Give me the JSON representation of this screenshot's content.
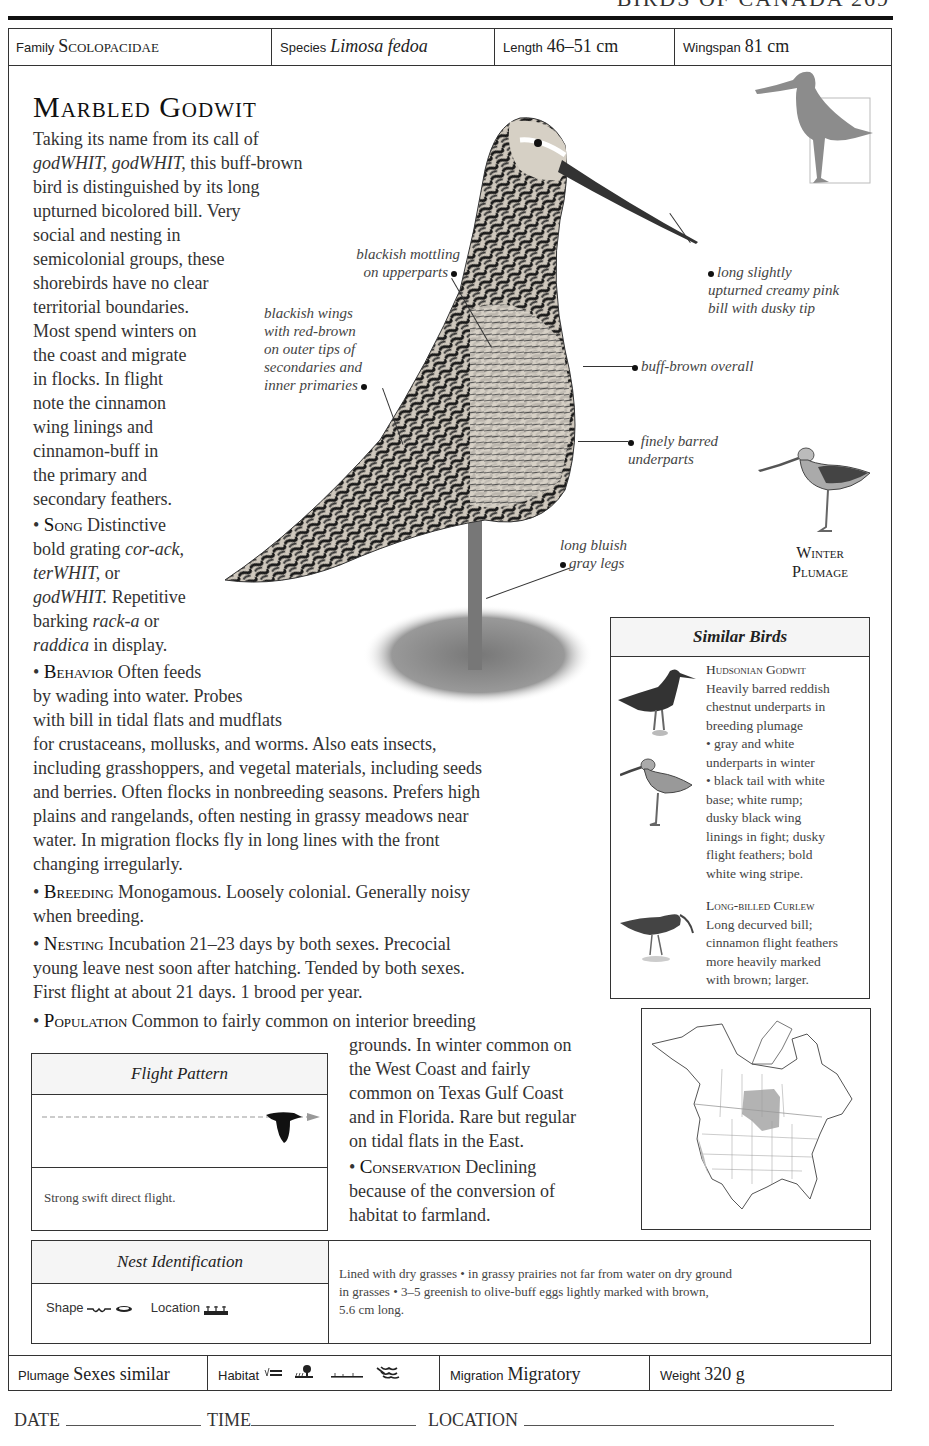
{
  "running_head": "BIRDS OF CANADA  269",
  "header": {
    "family_label": "Family",
    "family_value": "Scolopacidae",
    "species_label": "Species",
    "species_value": "Limosa fedoa",
    "length_label": "Length",
    "length_value": "46–51 cm",
    "wingspan_label": "Wingspan",
    "wingspan_value": "81 cm"
  },
  "title": "Marbled Godwit",
  "intro": {
    "l1": "Taking its name from its call of",
    "l2a": "godWHIT, godWHIT,",
    "l2b": " this buff-brown",
    "l3": "bird is distinguished by its long",
    "l4": "upturned bicolored bill. Very",
    "l5": "social and nesting in",
    "l6": "semicolonial groups, these",
    "l7": "shorebirds have no clear",
    "l8": "territorial boundaries.",
    "l9": "Most spend winters on",
    "l10": "the coast and migrate",
    "l11": "in flocks. In flight",
    "l12": "note the cinnamon",
    "l13": "wing linings and",
    "l14": "cinnamon-buff in",
    "l15": "the primary and",
    "l16": "secondary feathers."
  },
  "song": {
    "label": "Song",
    "l1": " Distinctive",
    "l2a": "bold grating ",
    "l2b": "cor-ack,",
    "l3a": "terWHIT,",
    "l3b": " or",
    "l4a": "godWHIT.",
    "l4b": " Repetitive",
    "l5a": "barking ",
    "l5b": "rack-a",
    "l5c": " or",
    "l6a": "raddica",
    "l6b": " in display."
  },
  "behavior": {
    "label": "Behavior",
    "l1": " Often feeds",
    "l2": "by wading into water. Probes",
    "l3": "with bill in tidal flats and mudflats",
    "l4": "for crustaceans, mollusks, and worms. Also eats insects,",
    "l5": "including grasshoppers, and vegetal materials, including seeds",
    "l6": "and berries. Often flocks in nonbreeding seasons. Prefers high",
    "l7": "plains and rangelands, often nesting in grassy meadows near",
    "l8": "water. In migration flocks fly in long lines with the front",
    "l9": "changing irregularly."
  },
  "breeding": {
    "label": "Breeding",
    "l1": " Monogamous. Loosely colonial. Generally noisy",
    "l2": "when breeding."
  },
  "nesting": {
    "label": "Nesting",
    "l1": " Incubation 21–23 days by both sexes. Precocial",
    "l2": "young leave nest soon after hatching. Tended by both sexes.",
    "l3": "First flight at about 21 days. 1 brood per year."
  },
  "population": {
    "label": "Population",
    "l1": " Common to fairly common on interior breeding",
    "l2": "grounds. In winter common on",
    "l3": "the West Coast and fairly",
    "l4": "common on Texas Gulf Coast",
    "l5": "and in Florida. Rare but regular",
    "l6": "on tidal flats in the East."
  },
  "conservation": {
    "label": "Conservation",
    "l1": " Declining",
    "l2": "because of the conversion of",
    "l3": "habitat to farmland."
  },
  "annotations": {
    "mottling_1": "blackish mottling",
    "mottling_2": "on upperparts",
    "wings_1": "blackish wings",
    "wings_2": "with red-brown",
    "wings_3": "on outer tips of",
    "wings_4": "secondaries and",
    "wings_5": "inner primaries",
    "bill_1": "long slightly",
    "bill_2": "upturned creamy pink",
    "bill_3": "bill with dusky tip",
    "overall": "buff-brown overall",
    "under_1": "finely barred",
    "under_2": "underparts",
    "legs_1": "long bluish",
    "legs_2": "gray legs",
    "winter_1": "Winter",
    "winter_2": "Plumage"
  },
  "similar_birds": {
    "title": "Similar Birds",
    "items": [
      {
        "name": "Hudsonian Godwit",
        "lines": [
          "Heavily barred reddish",
          "chestnut underparts in",
          "breeding plumage",
          "• gray and white",
          "underparts in winter",
          "• black tail with white",
          "base; white rump;",
          "dusky black wing",
          "linings in fight; dusky",
          "flight feathers; bold",
          "white wing stripe."
        ]
      },
      {
        "name": "Long-billed Curlew",
        "lines": [
          "Long decurved bill;",
          "cinnamon flight feathers",
          "more heavily marked",
          "with brown; larger."
        ]
      }
    ]
  },
  "flight_pattern": {
    "title": "Flight Pattern",
    "description": "Strong swift direct flight."
  },
  "nest_identification": {
    "title": "Nest Identification",
    "shape_label": "Shape",
    "location_label": "Location",
    "description_1": "Lined with dry grasses • in grassy prairies not far from water on dry ground",
    "description_2": "in grasses • 3–5 greenish to olive-buff eggs lightly marked with brown,",
    "description_3": "5.6 cm long."
  },
  "footer": {
    "plumage_label": "Plumage",
    "plumage_value": "Sexes similar",
    "habitat_label": "Habitat",
    "habitat_icons": [
      "marsh-icon",
      "tree-grassland-icon",
      "open-plains-icon",
      "shore-waves-icon"
    ],
    "migration_label": "Migration",
    "migration_value": "Migratory",
    "weight_label": "Weight",
    "weight_value": "320 g"
  },
  "log": {
    "date_label": "DATE",
    "time_label": "TIME",
    "location_label": "LOCATION"
  },
  "colors": {
    "ink": "#222222",
    "rule": "#111111",
    "range_shading": "#9a9a9a",
    "silhouette": "#8c8c8c"
  }
}
